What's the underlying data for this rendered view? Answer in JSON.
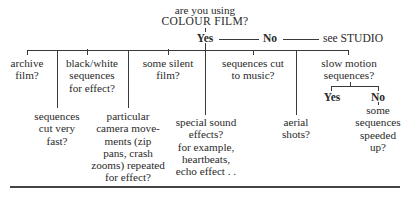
{
  "diagram": {
    "root": {
      "line1": "are you using",
      "line2": "COLOUR FILM?"
    },
    "answers": {
      "yes": "Yes",
      "no": "No",
      "no_target": "see STUDIO"
    },
    "branches": [
      {
        "id": "archive",
        "lines": [
          "archive",
          "film?"
        ]
      },
      {
        "id": "black-white",
        "lines": [
          "black/white",
          "sequences",
          "for effect?"
        ]
      },
      {
        "id": "silent",
        "lines": [
          "some silent",
          "film?"
        ]
      },
      {
        "id": "music",
        "lines": [
          "sequences cut",
          "to music?"
        ]
      },
      {
        "id": "slow-motion",
        "lines": [
          "slow motion",
          "sequences?"
        ]
      }
    ],
    "sub_branches": [
      {
        "id": "cut-fast",
        "lines": [
          "sequences",
          "cut very",
          "fast?"
        ]
      },
      {
        "id": "camera",
        "lines": [
          "particular",
          "camera move-",
          "ments (zip",
          "pans, crash",
          "zooms) repeated",
          "for effect?"
        ]
      },
      {
        "id": "sound",
        "lines": [
          "special sound",
          "effects?",
          "for example,",
          "heartbeats,",
          "echo effect . ."
        ]
      },
      {
        "id": "aerial",
        "lines": [
          "aerial",
          "shots?"
        ]
      }
    ],
    "slow_motion": {
      "yes": "Yes",
      "no": "No",
      "no_child": [
        "some",
        "sequences",
        "speeded",
        "up?"
      ]
    }
  }
}
